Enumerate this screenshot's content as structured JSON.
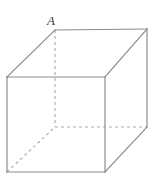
{
  "figure": {
    "type": "geometric-solid-diagram",
    "shape": "cube",
    "background_color": "#ffffff",
    "solid_edge_color": "#8c8c8c",
    "hidden_edge_color": "#b0b0b0",
    "label_color": "#3a3a3a",
    "edge_width": 1.2,
    "hidden_edge_dash": "3 3",
    "canvas": {
      "width": 155,
      "height": 180
    }
  },
  "labels": [
    {
      "name": "vertex-a",
      "text": "A",
      "x": 47,
      "y": 14,
      "describes": "top-back-left vertex"
    }
  ],
  "vertices": {
    "front_top_left": {
      "x": 7,
      "y": 77
    },
    "front_top_right": {
      "x": 105,
      "y": 77
    },
    "front_bottom_left": {
      "x": 7,
      "y": 172
    },
    "front_bottom_right": {
      "x": 105,
      "y": 172
    },
    "back_top_left": {
      "x": 55,
      "y": 30
    },
    "back_top_right": {
      "x": 147,
      "y": 29
    },
    "back_bottom_left": {
      "x": 55,
      "y": 127
    },
    "back_bottom_right": {
      "x": 147,
      "y": 127
    }
  },
  "edges": {
    "visible": [
      {
        "name": "front-face-top",
        "from": "front_top_left",
        "to": "front_top_right"
      },
      {
        "name": "front-face-right",
        "from": "front_top_right",
        "to": "front_bottom_right"
      },
      {
        "name": "front-face-bottom",
        "from": "front_bottom_right",
        "to": "front_bottom_left"
      },
      {
        "name": "front-face-left",
        "from": "front_bottom_left",
        "to": "front_top_left"
      },
      {
        "name": "top-back-edge",
        "from": "back_top_left",
        "to": "back_top_right"
      },
      {
        "name": "right-back-vertical",
        "from": "back_top_right",
        "to": "back_bottom_right"
      },
      {
        "name": "top-left-diagonal",
        "from": "front_top_left",
        "to": "back_top_left"
      },
      {
        "name": "top-right-diagonal",
        "from": "front_top_right",
        "to": "back_top_right"
      },
      {
        "name": "bottom-right-diagonal",
        "from": "front_bottom_right",
        "to": "back_bottom_right"
      }
    ],
    "hidden": [
      {
        "name": "back-left-vertical",
        "from": "back_top_left",
        "to": "back_bottom_left"
      },
      {
        "name": "bottom-back-edge",
        "from": "back_bottom_left",
        "to": "back_bottom_right"
      },
      {
        "name": "bottom-left-diagonal",
        "from": "front_bottom_left",
        "to": "back_bottom_left"
      }
    ]
  }
}
